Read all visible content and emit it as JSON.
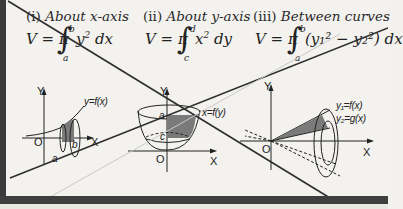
{
  "sections": [
    {
      "number": "(i)",
      "title": "About x-axis",
      "formula": {
        "lhs": "V = π",
        "integrand": "y",
        "power": "2",
        "differential": "dx",
        "lower": "a",
        "upper": "b"
      },
      "diagram": {
        "curve_label": "y=f(x)",
        "axis_y": "Y",
        "axis_x": "X",
        "origin": "O",
        "bound_a": "a",
        "bound_b": "b"
      }
    },
    {
      "number": "(ii)",
      "title": "About y-axis",
      "formula": {
        "lhs": "V = π",
        "integrand": "x",
        "power": "2",
        "differential": "dy",
        "lower": "c",
        "upper": "d"
      },
      "diagram": {
        "curve_label": "x=f(y)",
        "axis_y": "Y",
        "axis_x": "X",
        "origin": "O",
        "bound_a": "a",
        "bound_c": "c"
      }
    },
    {
      "number": "(iii)",
      "title": "Between curves",
      "formula": {
        "lhs": "V = π",
        "integrand": "(y₁² − y₂²)",
        "differential": "dx",
        "lower": "a",
        "upper": "b"
      },
      "diagram": {
        "curve1_label": "y₁=f(x)",
        "curve2_label": "y₂=g(x)",
        "axis_y": "Y",
        "axis_x": "X",
        "origin": "O"
      }
    }
  ],
  "colors": {
    "paper": "#f3f2ef",
    "ink": "#222222",
    "shade": "#6e6e6e",
    "overlay_line": "#2e2e2e",
    "faint_line": "#c9c9c9"
  }
}
